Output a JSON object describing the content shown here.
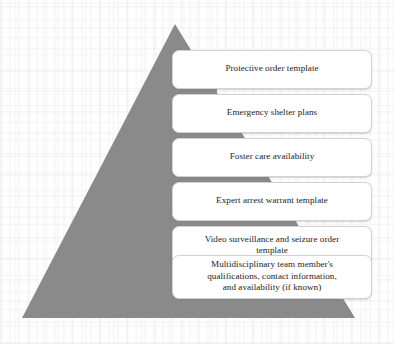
{
  "diagram": {
    "type": "pyramid",
    "title": "",
    "shape_color": "#8a8a8a",
    "box_fill": "#ffffff",
    "box_border": "#d2d2d2",
    "text_color": "#232323",
    "apex": {
      "x": 175,
      "y": 24
    },
    "base": {
      "left_x": 22,
      "right_x": 355,
      "y": 318
    },
    "levels": [
      {
        "index": 1,
        "label": "Protective order template",
        "box": {
          "x": 172,
          "y": 50,
          "width": 200,
          "height": 39
        },
        "stem": {
          "x": 169,
          "y": 86,
          "width": 48,
          "height": 6
        }
      },
      {
        "index": 2,
        "label": "Emergency shelter plans",
        "box": {
          "x": 172,
          "y": 94,
          "width": 200,
          "height": 39
        },
        "stem": {
          "x": 169,
          "y": 130,
          "width": 68,
          "height": 6
        }
      },
      {
        "index": 3,
        "label": "Foster care availability",
        "box": {
          "x": 172,
          "y": 138,
          "width": 200,
          "height": 39
        },
        "stem": {
          "x": 169,
          "y": 174,
          "width": 88,
          "height": 6
        }
      },
      {
        "index": 4,
        "label": "Expert arrest warrant template",
        "box": {
          "x": 172,
          "y": 182,
          "width": 200,
          "height": 39
        },
        "stem": {
          "x": 169,
          "y": 218,
          "width": 108,
          "height": 6
        }
      },
      {
        "index": 5,
        "label": "Video surveillance and seizure order\ntemplate",
        "box": {
          "x": 172,
          "y": 226,
          "width": 200,
          "height": 39
        },
        "stem": {
          "x": 169,
          "y": 262,
          "width": 128,
          "height": 6
        }
      },
      {
        "index": 6,
        "label": "Multidisciplinary team member's\nqualifications, contact information,\nand availability (if known)",
        "box": {
          "x": 172,
          "y": 255,
          "width": 200,
          "height": 44
        },
        "stem": {
          "x": 169,
          "y": 296,
          "width": 148,
          "height": 6
        }
      }
    ]
  }
}
